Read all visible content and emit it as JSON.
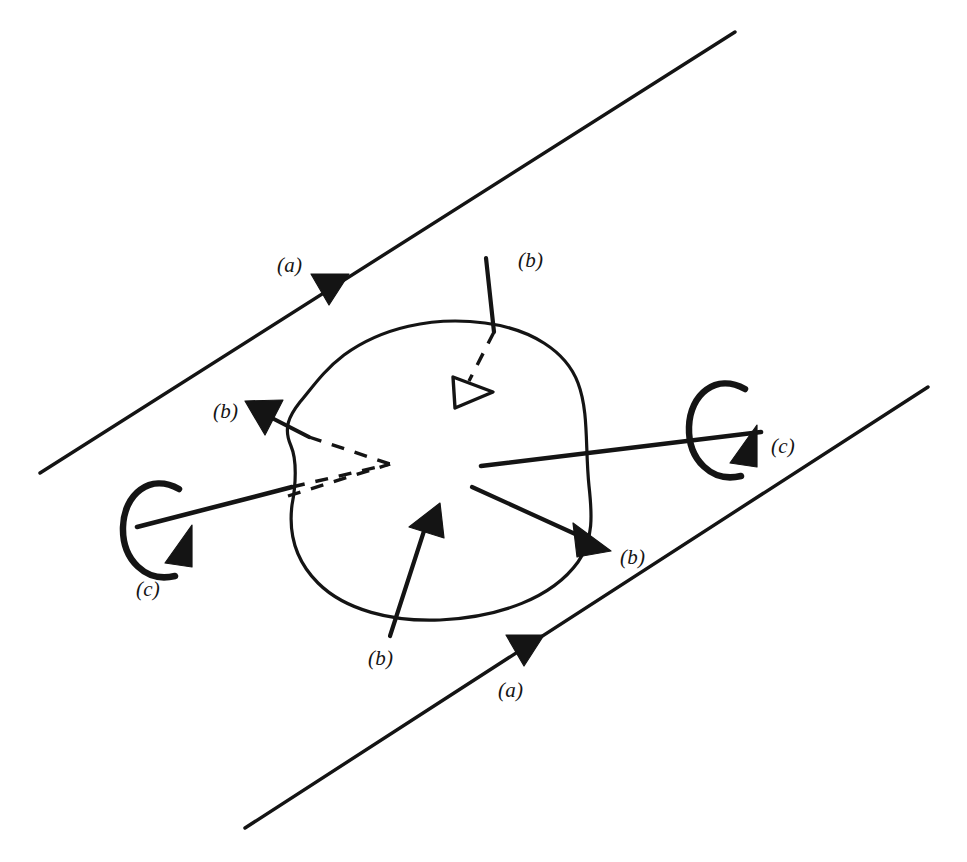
{
  "figure": {
    "title_strip": "",
    "width": 967,
    "height": 862,
    "ink_color": "#141414",
    "background_color": "#ffffff",
    "labels": {
      "guide_upper": "(a)",
      "guide_lower": "(a)",
      "rotation_left": "(c)",
      "rotation_right": "(c)",
      "translation_top": "(b)",
      "translation_left": "(b)",
      "translation_bottom": "(b)",
      "translation_right": "(b)"
    },
    "label_positions": {
      "guide_upper": {
        "x": 277,
        "y": 253
      },
      "guide_lower": {
        "x": 498,
        "y": 678
      },
      "rotation_left": {
        "x": 136,
        "y": 577
      },
      "rotation_right": {
        "x": 771,
        "y": 434
      },
      "translation_top": {
        "x": 518,
        "y": 248
      },
      "translation_left": {
        "x": 213,
        "y": 399
      },
      "translation_bottom": {
        "x": 368,
        "y": 646
      },
      "translation_right": {
        "x": 620,
        "y": 545
      }
    },
    "geometry": {
      "guide_upper_line": {
        "x1": 40,
        "y1": 473,
        "x2": 735,
        "y2": 32
      },
      "guide_lower_line": {
        "x1": 245,
        "y1": 828,
        "x2": 928,
        "y2": 387
      },
      "guide_upper_marker": {
        "x": 328,
        "y": 282,
        "angle_deg": 148
      },
      "guide_lower_marker": {
        "x": 523,
        "y": 643,
        "angle_deg": 148
      },
      "body_outline_path": "M 485 323 C 432 316, 381 328, 344 355 C 323 371, 312 388, 300 402 C 289 416, 283 428, 291 446 C 297 460, 296 484, 292 505 C 288 537, 298 563, 318 583 C 345 610, 392 622, 440 620 C 500 617, 552 598, 578 562 C 594 540, 592 513, 589 486 C 585 448, 589 412, 578 383 C 566 351, 531 329, 485 323 Z",
      "axis_left": {
        "solid": {
          "x1": 137,
          "y1": 527,
          "x2": 292,
          "y2": 487
        },
        "hidden": {
          "x1": 292,
          "y1": 487,
          "x2": 388,
          "y2": 465
        }
      },
      "axis_right": {
        "solid": {
          "x1": 481,
          "y1": 466,
          "x2": 761,
          "y2": 432
        }
      },
      "rotation_left_loop": {
        "cx": 153,
        "cy": 527,
        "rx": 28,
        "ry": 45
      },
      "rotation_right_loop": {
        "cx": 718,
        "cy": 427,
        "rx": 28,
        "ry": 45
      },
      "vector_top": {
        "solid": {
          "x1": 486,
          "y1": 258,
          "x2": 493,
          "y2": 331
        },
        "hidden": {
          "x1": 493,
          "y1": 331,
          "x2": 466,
          "y2": 385
        },
        "head_kind": "hollow"
      },
      "vector_left": {
        "solid": {
          "x1": 309,
          "y1": 437,
          "x2": 262,
          "y2": 414
        },
        "hidden": [
          {
            "x1": 309,
            "y1": 437,
            "x2": 388,
            "y2": 465
          },
          {
            "x1": 290,
            "y1": 495,
            "x2": 388,
            "y2": 465
          }
        ],
        "head_kind": "solid"
      },
      "vector_bottom": {
        "solid": {
          "x1": 391,
          "y1": 635,
          "x2": 426,
          "y2": 527
        },
        "head_kind": "solid"
      },
      "vector_right": {
        "solid": {
          "x1": 473,
          "y1": 487,
          "x2": 594,
          "y2": 542
        },
        "head_kind": "solid"
      }
    }
  }
}
